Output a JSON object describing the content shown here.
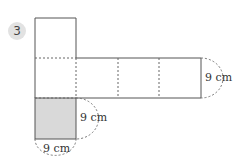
{
  "problem": {
    "number": "3"
  },
  "figure": {
    "type": "cube net (rectangular prism net)",
    "labels": {
      "right_height": "9 cm",
      "shaded_side": "9 cm",
      "shaded_bottom": "9 cm"
    },
    "colors": {
      "line": "#555555",
      "shaded": "#d9d9d9",
      "badge": "#e2e2e2"
    }
  }
}
